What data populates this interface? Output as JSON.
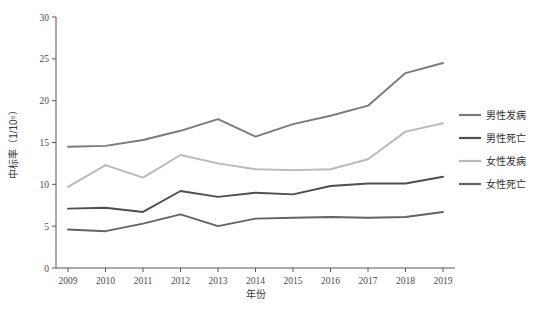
{
  "chart_data": {
    "type": "line",
    "title": "",
    "xlabel": "年份",
    "ylabel": "中标率（1/10⁵）",
    "x": [
      2009,
      2010,
      2011,
      2012,
      2013,
      2014,
      2015,
      2016,
      2017,
      2018,
      2019
    ],
    "categories": [
      "2009",
      "2010",
      "2011",
      "2012",
      "2013",
      "2014",
      "2015",
      "2016",
      "2017",
      "2018",
      "2019"
    ],
    "xtick_labels": [
      "2009",
      "2010",
      "2011",
      "2012",
      "2013",
      "2014",
      "2015",
      "2016",
      "2017",
      "2018",
      "2019"
    ],
    "ytick_labels": [
      "0",
      "5",
      "10",
      "15",
      "20",
      "25",
      "30"
    ],
    "yticks": [
      0,
      5,
      10,
      15,
      20,
      25,
      30
    ],
    "ylim": [
      0,
      30
    ],
    "xlim": [
      2009,
      2019
    ],
    "grid": false,
    "legend_position": "right",
    "series": [
      {
        "name": "男性发病",
        "color": "#7a7a7a",
        "values": [
          14.5,
          14.6,
          15.3,
          16.4,
          17.8,
          15.7,
          17.2,
          18.2,
          19.4,
          23.3,
          24.5
        ]
      },
      {
        "name": "男性死亡",
        "color": "#4e4e4e",
        "values": [
          7.1,
          7.2,
          6.7,
          9.2,
          8.5,
          9.0,
          8.8,
          9.8,
          10.1,
          10.1,
          10.9
        ]
      },
      {
        "name": "女性发病",
        "color": "#b9b9b9",
        "values": [
          9.7,
          12.3,
          10.8,
          13.5,
          12.5,
          11.8,
          11.7,
          11.8,
          13.0,
          16.3,
          17.3
        ]
      },
      {
        "name": "女性死亡",
        "color": "#636363",
        "values": [
          4.6,
          4.4,
          5.3,
          6.4,
          5.0,
          5.9,
          6.0,
          6.1,
          6.0,
          6.1,
          6.7
        ]
      }
    ]
  },
  "legend": {
    "items": [
      {
        "label": "男性发病",
        "color": "#7a7a7a"
      },
      {
        "label": "男性死亡",
        "color": "#4e4e4e"
      },
      {
        "label": "女性发病",
        "color": "#b9b9b9"
      },
      {
        "label": "女性死亡",
        "color": "#636363"
      }
    ]
  },
  "axes": {
    "y_title": "中标率（1/10⁵）",
    "x_title": "年份"
  }
}
